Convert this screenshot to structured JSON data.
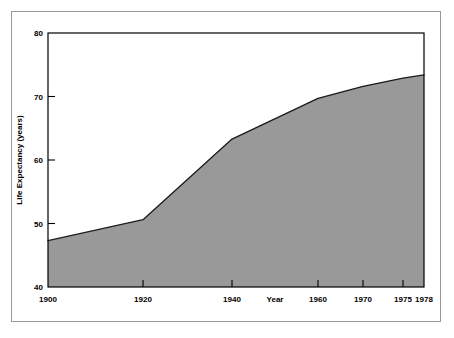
{
  "chart_data": {
    "type": "area",
    "title": "",
    "xlabel": "Year",
    "ylabel": "Life Expectancy (years)",
    "x": [
      1900,
      1920,
      1940,
      1960,
      1970,
      1975,
      1978
    ],
    "values": [
      47.3,
      50.6,
      63.3,
      69.7,
      71.6,
      72.9,
      73.4
    ],
    "series": [
      {
        "name": "Life Expectancy",
        "values": [
          47.3,
          50.6,
          63.3,
          69.7,
          71.6,
          72.9,
          73.4
        ]
      }
    ],
    "xtick_labels": [
      "1900",
      "1920",
      "1940",
      "1960",
      "1970",
      "1975",
      "1978"
    ],
    "xtick_values": [
      1900,
      1920,
      1940,
      1960,
      1970,
      1975,
      1978
    ],
    "ytick_labels": [
      "40",
      "50",
      "60",
      "70",
      "80"
    ],
    "ytick_values": [
      40,
      50,
      60,
      70,
      80
    ],
    "xlim": [
      1900,
      1978
    ],
    "ylim": [
      40,
      80
    ],
    "grid": false,
    "legend": "none",
    "fill_color": "#999999",
    "line_color": "#1a1a1a",
    "frame_color": "#000000",
    "background_color": "#ffffff"
  },
  "axes": {
    "y_title": "Life Expectancy (years)",
    "x_title": "Year",
    "y_ticks": [
      {
        "label": "80",
        "value": 80
      },
      {
        "label": "70",
        "value": 70
      },
      {
        "label": "60",
        "value": 60
      },
      {
        "label": "50",
        "value": 50
      },
      {
        "label": "40",
        "value": 40
      }
    ],
    "x_ticks": [
      {
        "label": "1900",
        "value": 1900
      },
      {
        "label": "1920",
        "value": 1920
      },
      {
        "label": "1940",
        "value": 1940
      },
      {
        "label": "1960",
        "value": 1960
      },
      {
        "label": "1970",
        "value": 1970
      },
      {
        "label": "1975",
        "value": 1975
      },
      {
        "label": "1978",
        "value": 1978
      }
    ]
  }
}
